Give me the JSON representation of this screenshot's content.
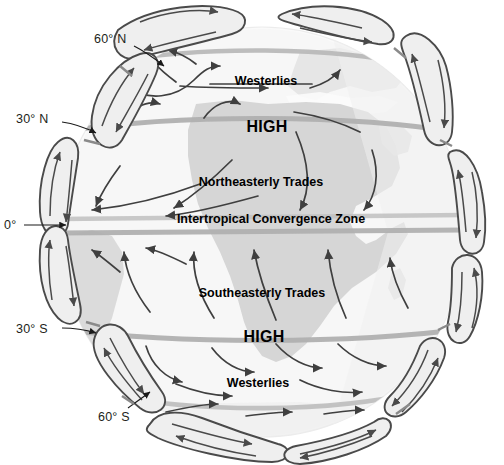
{
  "figure": {
    "type": "earth-wind-circulation-schematic",
    "background_color": "#ffffff",
    "globe_fill": "#fbfbfb",
    "ocean_fill": "#f4f4f4",
    "land_fill": "#d8d8d8",
    "latitude_band_color": "#b5b5b5",
    "cell_loop_fill": "#eeeeee",
    "cell_loop_stroke": "#4a4a4a",
    "arrow_color": "#3f3f3f",
    "text_color": "#231f20"
  },
  "latitude_labels": [
    {
      "id": "lat-60n",
      "text": "60° N",
      "x": 94,
      "y": 38
    },
    {
      "id": "lat-30n",
      "text": "30° N",
      "x": 18,
      "y": 118
    },
    {
      "id": "lat-0",
      "text": "0°",
      "x": 12,
      "y": 223
    },
    {
      "id": "lat-30s",
      "text": "30° S",
      "x": 18,
      "y": 324
    },
    {
      "id": "lat-60s",
      "text": "60° S",
      "x": 99,
      "y": 411
    }
  ],
  "wind_labels": [
    {
      "id": "westerlies-north",
      "text": "Westerlies",
      "x": 266,
      "y": 74,
      "size": "sz"
    },
    {
      "id": "high-north",
      "text": "HIGH",
      "x": 267,
      "y": 119,
      "size": "high"
    },
    {
      "id": "ne-trades",
      "text": "Northeasterly Trades",
      "x": 261,
      "y": 177,
      "size": "sz"
    },
    {
      "id": "itcz",
      "text": "Intertropical Convergence Zone",
      "x": 271,
      "y": 216,
      "size": "sz"
    },
    {
      "id": "se-trades",
      "text": "Southeasterly Trades",
      "x": 262,
      "y": 288,
      "size": "sz"
    },
    {
      "id": "high-south",
      "text": "HIGH",
      "x": 264,
      "y": 330,
      "size": "high"
    },
    {
      "id": "westerlies-south",
      "text": "Westerlies",
      "x": 258,
      "y": 378,
      "size": "sz"
    }
  ],
  "latitude_bands": [
    {
      "id": "band-60n",
      "label": "60° N",
      "opacity": 0.85
    },
    {
      "id": "band-30n",
      "label": "30° N",
      "opacity": 0.9
    },
    {
      "id": "band-itcz",
      "label": "Intertropical Convergence Zone",
      "opacity": 0.75
    },
    {
      "id": "band-equator",
      "label": "0°",
      "opacity": 0.9
    },
    {
      "id": "band-30s",
      "label": "30° S",
      "opacity": 0.9
    },
    {
      "id": "band-60s",
      "label": "60° S",
      "opacity": 0.8
    }
  ],
  "circulation_cells": [
    {
      "id": "cell-polar-nw",
      "hemisphere": "north",
      "side": "west",
      "type": "polar"
    },
    {
      "id": "cell-ferrel-nw",
      "hemisphere": "north",
      "side": "west",
      "type": "ferrel"
    },
    {
      "id": "cell-hadley-nw",
      "hemisphere": "north",
      "side": "west",
      "type": "hadley"
    },
    {
      "id": "cell-hadley-sw",
      "hemisphere": "south",
      "side": "west",
      "type": "hadley"
    },
    {
      "id": "cell-ferrel-sw",
      "hemisphere": "south",
      "side": "west",
      "type": "ferrel"
    },
    {
      "id": "cell-polar-sw",
      "hemisphere": "south",
      "side": "west",
      "type": "polar"
    },
    {
      "id": "cell-polar-ne",
      "hemisphere": "north",
      "side": "east",
      "type": "polar"
    },
    {
      "id": "cell-ferrel-ne",
      "hemisphere": "north",
      "side": "east",
      "type": "ferrel"
    },
    {
      "id": "cell-hadley-ne",
      "hemisphere": "north",
      "side": "east",
      "type": "hadley"
    },
    {
      "id": "cell-hadley-se",
      "hemisphere": "south",
      "side": "east",
      "type": "hadley"
    },
    {
      "id": "cell-ferrel-se",
      "hemisphere": "south",
      "side": "east",
      "type": "ferrel"
    },
    {
      "id": "cell-polar-se",
      "hemisphere": "south",
      "side": "east",
      "type": "polar"
    }
  ],
  "corner_note": {
    "text": ""
  }
}
